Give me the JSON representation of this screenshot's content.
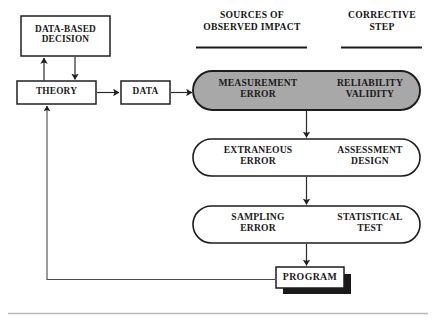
{
  "figure": {
    "background_color": "#ffffff",
    "line_color": "#222222",
    "shaded_fill": "#a8a8a8",
    "text_color": "#1a1a1a"
  },
  "column_headers": [
    {
      "id": "sources",
      "label": "SOURCES OF\nOBSERVED IMPACT"
    },
    {
      "id": "corrective",
      "label": "CORRECTIVE\nSTEP"
    }
  ],
  "boxes": [
    {
      "id": "data-based-decision",
      "label": "DATA-BASED\nDECISION"
    },
    {
      "id": "theory",
      "label": "THEORY"
    },
    {
      "id": "data",
      "label": "DATA"
    },
    {
      "id": "program",
      "label": "PROGRAM"
    }
  ],
  "ovals": [
    {
      "id": "measurement",
      "shaded": "yes",
      "fill": "#a8a8a8",
      "source_label": "MEASUREMENT\nERROR",
      "corrective_label": "RELIABILITY\nVALIDITY"
    },
    {
      "id": "extraneous",
      "shaded": "no",
      "fill": "#ffffff",
      "source_label": "EXTRANEOUS\nERROR",
      "corrective_label": "ASSESSMENT\nDESIGN"
    },
    {
      "id": "sampling",
      "shaded": "no",
      "fill": "#ffffff",
      "source_label": "SAMPLING\nERROR",
      "corrective_label": "STATISTICAL\nTEST"
    }
  ],
  "connectors": [
    {
      "id": "theory-to-decision",
      "direction": "up"
    },
    {
      "id": "decision-to-theory",
      "direction": "down"
    },
    {
      "id": "theory-to-data",
      "direction": "right"
    },
    {
      "id": "data-to-measurement",
      "direction": "right"
    },
    {
      "id": "measurement-to-extraneous",
      "direction": "down"
    },
    {
      "id": "extraneous-to-sampling",
      "direction": "down"
    },
    {
      "id": "sampling-to-program",
      "direction": "down"
    },
    {
      "id": "program-to-theory-feedback",
      "direction": "up-left"
    }
  ]
}
